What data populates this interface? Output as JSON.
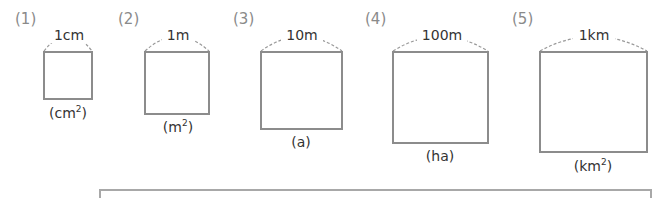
{
  "problems": [
    {
      "number": "(1)",
      "side": "1cm",
      "unit_base": "cm",
      "unit_sup": "2",
      "unit_close": ")"
    },
    {
      "number": "(2)",
      "side": "1m",
      "unit_base": "m",
      "unit_sup": "2",
      "unit_close": ")"
    },
    {
      "number": "(3)",
      "side": "10m",
      "unit_base": "a",
      "unit_sup": "",
      "unit_close": ")"
    },
    {
      "number": "(4)",
      "side": "100m",
      "unit_base": "ha",
      "unit_sup": "",
      "unit_close": ")"
    },
    {
      "number": "(5)",
      "side": "1km",
      "unit_base": "km",
      "unit_sup": "2",
      "unit_close": ")"
    }
  ],
  "colors": {
    "number": "#8a8a8a",
    "border": "#8c8c8c",
    "text": "#333333"
  }
}
